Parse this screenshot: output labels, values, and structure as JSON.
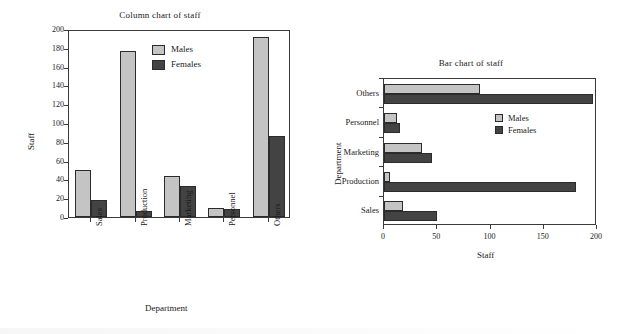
{
  "colors": {
    "males": "#c4c4c4",
    "females": "#434343",
    "axis": "#3a3a3a",
    "text": "#1a1a1a",
    "background": "#ffffff"
  },
  "chart_data": [
    {
      "id": "column-chart",
      "type": "bar",
      "orientation": "vertical",
      "title": "Column chart of staff",
      "xlabel": "Department",
      "ylabel": "Staff",
      "categories": [
        "Sales",
        "Production",
        "Marketing",
        "Personnel",
        "Others"
      ],
      "series": [
        {
          "name": "Males",
          "color": "#c4c4c4",
          "values": [
            50,
            177,
            44,
            10,
            191
          ]
        },
        {
          "name": "Females",
          "color": "#434343",
          "values": [
            18,
            6,
            33,
            8,
            86
          ]
        }
      ],
      "ylim": [
        0,
        200
      ],
      "yticks": [
        0,
        20,
        40,
        60,
        80,
        100,
        120,
        140,
        160,
        180,
        200
      ],
      "grid": false,
      "legend": {
        "position": "top-center",
        "entries": [
          "Males",
          "Females"
        ]
      }
    },
    {
      "id": "bar-chart",
      "type": "bar",
      "orientation": "horizontal",
      "title": "Bar chart of staff",
      "xlabel": "Staff",
      "ylabel": "Department",
      "categories": [
        "Sales",
        "Production",
        "Marketing",
        "Personnel",
        "Others"
      ],
      "series": [
        {
          "name": "Males",
          "color": "#c4c4c4",
          "values": [
            18,
            6,
            36,
            12,
            90
          ]
        },
        {
          "name": "Females",
          "color": "#434343",
          "values": [
            50,
            180,
            45,
            15,
            196
          ]
        }
      ],
      "xlim": [
        0,
        200
      ],
      "xticks": [
        0,
        50,
        100,
        150,
        200
      ],
      "grid": false,
      "legend": {
        "position": "bottom-right",
        "entries": [
          "Males",
          "Females"
        ]
      }
    }
  ]
}
